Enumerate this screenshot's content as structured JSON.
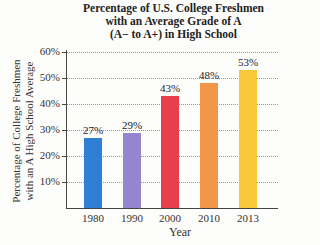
{
  "chart_data": {
    "type": "bar",
    "title": "Percentage of U.S. College Freshmen with an Average Grade of A (A− to A+) in High School",
    "title_lines": [
      "Percentage of U.S. College Freshmen",
      "with an Average Grade of A",
      "(A− to A+) in High School"
    ],
    "xlabel": "Year",
    "ylabel": "Percentage of College Freshmen with an A High School Average",
    "ylabel_lines": [
      "Percentage of College Freshmen",
      "with an A High School Average"
    ],
    "categories": [
      "1980",
      "1990",
      "2000",
      "2010",
      "2013"
    ],
    "values": [
      27,
      29,
      43,
      48,
      53
    ],
    "value_labels": [
      "27%",
      "29%",
      "43%",
      "48%",
      "53%"
    ],
    "colors": [
      "#2f7fd6",
      "#9585cf",
      "#e8404a",
      "#f2964a",
      "#f8c83a"
    ],
    "ylim": [
      0,
      60
    ],
    "yticks": [
      "10%",
      "20%",
      "30%",
      "40%",
      "50%",
      "60%"
    ],
    "ytick_values": [
      10,
      20,
      30,
      40,
      50,
      60
    ],
    "grid": true,
    "legend": null
  }
}
